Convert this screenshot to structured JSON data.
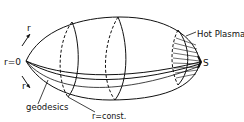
{
  "diagram": {
    "labels": {
      "r_top": "r",
      "r_bottom": "r",
      "origin": "r=0",
      "geodesics": "geodesics",
      "r_const": "r=const.",
      "hot_plasma": "Hot Plasma",
      "s_point": "S"
    },
    "colors": {
      "ink": "#111111",
      "background": "#ffffff"
    }
  }
}
